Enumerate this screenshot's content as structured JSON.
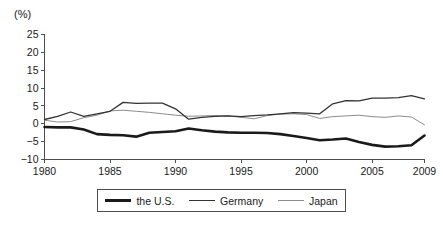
{
  "chart_data": {
    "type": "line",
    "title": "",
    "subtitle": "",
    "xlabel": "",
    "ylabel": "",
    "unit_label": "(%)",
    "grid": false,
    "legend_position": "bottom",
    "xlim": [
      1980,
      2009
    ],
    "ylim": [
      -10,
      25
    ],
    "xticks": [
      1980,
      1985,
      1990,
      1995,
      2000,
      2005,
      2009
    ],
    "xtick_labels": [
      "1980",
      "1985",
      "1990",
      "1995",
      "2000",
      "2005",
      "2009"
    ],
    "yticks": [
      -10,
      -5,
      0,
      5,
      10,
      15,
      20,
      25
    ],
    "ytick_labels": [
      "−10",
      "−5",
      "0",
      "5",
      "10",
      "15",
      "20",
      "25"
    ],
    "x": [
      1980,
      1981,
      1982,
      1983,
      1984,
      1985,
      1986,
      1987,
      1988,
      1989,
      1990,
      1991,
      1992,
      1993,
      1994,
      1995,
      1996,
      1997,
      1998,
      1999,
      2000,
      2001,
      2002,
      2003,
      2004,
      2005,
      2006,
      2007,
      2008,
      2009
    ],
    "series": [
      {
        "name": "the U.S.",
        "color": "#1a1a1a",
        "width": 2.6,
        "values": [
          -0.9,
          -1.0,
          -1.0,
          -1.6,
          -2.9,
          -3.1,
          -3.2,
          -3.6,
          -2.5,
          -2.3,
          -2.1,
          -1.3,
          -1.8,
          -2.2,
          -2.4,
          -2.5,
          -2.5,
          -2.6,
          -2.9,
          -3.4,
          -4.0,
          -4.6,
          -4.4,
          -4.1,
          -5.1,
          -5.9,
          -6.4,
          -6.3,
          -6.0,
          -3.3
        ]
      },
      {
        "name": "Germany",
        "color": "#333333",
        "width": 1.3,
        "values": [
          1.2,
          2.1,
          3.3,
          2.1,
          2.8,
          3.5,
          6.0,
          5.7,
          5.8,
          5.8,
          4.2,
          1.3,
          1.8,
          2.1,
          2.2,
          2.0,
          2.3,
          2.5,
          2.8,
          3.1,
          3.0,
          2.8,
          5.6,
          6.5,
          6.4,
          7.2,
          7.2,
          7.3,
          7.9,
          7.0
        ]
      },
      {
        "name": "Japan",
        "color": "#8c8c8c",
        "width": 1.0,
        "values": [
          1.0,
          0.5,
          0.6,
          1.7,
          2.4,
          3.6,
          3.8,
          3.5,
          3.2,
          2.8,
          2.4,
          2.1,
          2.2,
          2.3,
          2.2,
          1.8,
          1.4,
          2.3,
          2.7,
          2.8,
          2.6,
          1.5,
          2.0,
          2.2,
          2.4,
          2.0,
          1.8,
          2.2,
          1.9,
          -0.3
        ]
      }
    ],
    "legend": [
      {
        "label": "the U.S.",
        "color": "#1a1a1a",
        "width": 2.6
      },
      {
        "label": "Germany",
        "color": "#333333",
        "width": 1.3
      },
      {
        "label": "Japan",
        "color": "#8c8c8c",
        "width": 1.0
      }
    ]
  }
}
